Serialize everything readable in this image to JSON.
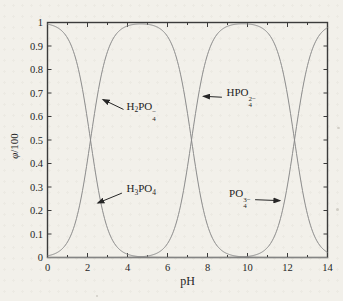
{
  "chart_data": {
    "type": "line",
    "title": "",
    "xlabel": "pH",
    "ylabel_parts": [
      {
        "t": "φ",
        "italic": true
      },
      {
        "t": "/100"
      }
    ],
    "xlim": [
      0,
      14
    ],
    "ylim": [
      0,
      1
    ],
    "grid": false,
    "legend": "inline-annotations",
    "xticks": [
      0,
      2,
      4,
      6,
      8,
      10,
      12,
      14
    ],
    "xtick_labels": [
      "0",
      "2",
      "4",
      "6",
      "8",
      "10",
      "12",
      "14"
    ],
    "x_minor_ticks": [
      1,
      3,
      5,
      7,
      9,
      11,
      13
    ],
    "yticks": [
      0,
      0.1,
      0.2,
      0.3,
      0.4,
      0.5,
      0.6,
      0.7,
      0.8,
      0.9,
      1
    ],
    "ytick_labels": [
      "0",
      "0.1",
      "0.2",
      "0.3",
      "0.4",
      "0.5",
      "0.6",
      "0.7",
      "0.8",
      "0.9",
      "1"
    ],
    "pKa": [
      2.15,
      7.2,
      12.35
    ],
    "x_sample": [
      0,
      1,
      2,
      3,
      4,
      5,
      6,
      7,
      8,
      9,
      10,
      11,
      12,
      13,
      14
    ],
    "series": [
      {
        "id": "h3po4",
        "name": "H3PO4",
        "alpha_index": 0,
        "values": [
          0.993,
          0.934,
          0.585,
          0.124,
          0.014,
          0.001,
          0,
          0,
          0,
          0,
          0,
          0,
          0,
          0,
          0
        ]
      },
      {
        "id": "h2po4",
        "name": "H2PO4-",
        "alpha_index": 1,
        "values": [
          0.007,
          0.066,
          0.414,
          0.876,
          0.985,
          0.992,
          0.94,
          0.613,
          0.137,
          0.016,
          0.002,
          0,
          0,
          0,
          0
        ]
      },
      {
        "id": "hpo4",
        "name": "HPO4 2-",
        "alpha_index": 2,
        "values": [
          0,
          0,
          0,
          0,
          0.001,
          0.006,
          0.059,
          0.387,
          0.863,
          0.984,
          0.994,
          0.957,
          0.691,
          0.183,
          0.022
        ]
      },
      {
        "id": "po4",
        "name": "PO4 3-",
        "alpha_index": 3,
        "values": [
          0,
          0,
          0,
          0,
          0,
          0,
          0,
          0,
          0,
          0,
          0.004,
          0.043,
          0.309,
          0.817,
          0.978
        ]
      }
    ],
    "annotations": [
      {
        "id": "h2po4",
        "parts": [
          {
            "t": "H"
          },
          {
            "t": "2",
            "s": "sub"
          },
          {
            "t": "PO"
          },
          {
            "sub": "4",
            "sup": "−"
          }
        ],
        "text_at": [
          3.95,
          0.62
        ],
        "arrow_from": [
          3.8,
          0.63
        ],
        "arrow_to": [
          2.78,
          0.672
        ]
      },
      {
        "id": "hpo4",
        "parts": [
          {
            "t": "HPO"
          },
          {
            "sub": "4",
            "sup": "2−"
          }
        ],
        "text_at": [
          8.95,
          0.678
        ],
        "arrow_from": [
          8.72,
          0.682
        ],
        "arrow_to": [
          7.8,
          0.686
        ]
      },
      {
        "id": "h3po4",
        "parts": [
          {
            "t": "H"
          },
          {
            "t": "3",
            "s": "sub"
          },
          {
            "t": "PO"
          },
          {
            "t": "4",
            "s": "sub"
          }
        ],
        "text_at": [
          3.95,
          0.288
        ],
        "arrow_from": [
          3.72,
          0.274
        ],
        "arrow_to": [
          2.52,
          0.232
        ]
      },
      {
        "id": "po4",
        "parts": [
          {
            "t": "PO"
          },
          {
            "sub": "4",
            "sup": "3−"
          }
        ],
        "text_at": [
          9.08,
          0.247
        ],
        "arrow_from": [
          10.38,
          0.246
        ],
        "arrow_to": [
          11.62,
          0.242
        ]
      }
    ],
    "line_color": "#8b8b8b",
    "axis_color": "#3b3b3b",
    "annotation_color": "#262626"
  }
}
